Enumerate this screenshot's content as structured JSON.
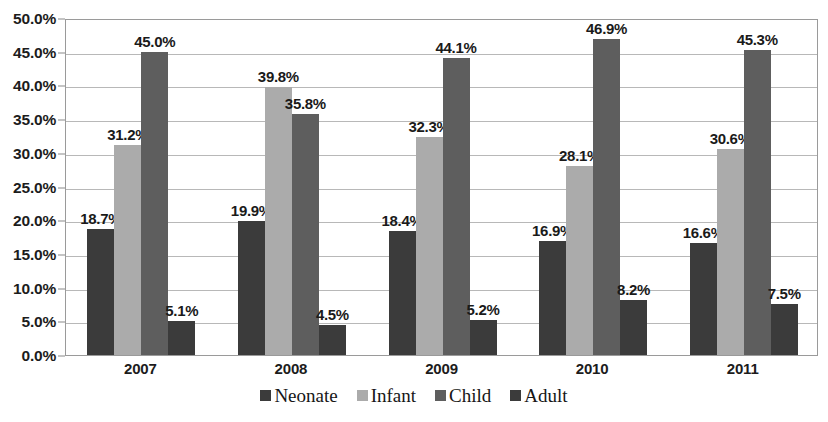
{
  "chart_data": {
    "type": "bar",
    "title": "",
    "subtitle": "",
    "xlabel": "",
    "ylabel": "",
    "categories": [
      "2007",
      "2008",
      "2009",
      "2010",
      "2011"
    ],
    "series": [
      {
        "name": "Neonate",
        "color": "#3b3b3b",
        "values": [
          18.7,
          19.9,
          18.4,
          16.9,
          16.6
        ]
      },
      {
        "name": "Infant",
        "color": "#ababab",
        "values": [
          31.2,
          39.8,
          32.3,
          28.1,
          30.6
        ]
      },
      {
        "name": "Child",
        "color": "#5e5e5e",
        "values": [
          45.0,
          35.8,
          44.1,
          46.9,
          45.3
        ]
      },
      {
        "name": "Adult",
        "color": "#3b3b3b",
        "values": [
          5.1,
          4.5,
          5.2,
          8.2,
          7.5
        ]
      }
    ],
    "data_labels": [
      [
        "18.7%",
        "31.2%",
        "45.0%",
        "5.1%"
      ],
      [
        "19.9%",
        "39.8%",
        "35.8%",
        "4.5%"
      ],
      [
        "18.4%",
        "32.3%",
        "44.1%",
        "5.2%"
      ],
      [
        "16.9%",
        "28.1%",
        "46.9%",
        "8.2%"
      ],
      [
        "16.6%",
        "30.6%",
        "45.3%",
        "7.5%"
      ]
    ],
    "ylim": [
      0,
      50
    ],
    "ytick_step": 5,
    "ytick_labels": [
      "0.0%",
      "5.0%",
      "10.0%",
      "15.0%",
      "20.0%",
      "25.0%",
      "30.0%",
      "35.0%",
      "40.0%",
      "45.0%",
      "50.0%"
    ],
    "ytick_values": [
      0,
      5,
      10,
      15,
      20,
      25,
      30,
      35,
      40,
      45,
      50
    ],
    "grid": true,
    "grid_axis": "y",
    "legend_position": "bottom",
    "legend_entries": [
      "Neonate",
      "Infant",
      "Child",
      "Adult"
    ],
    "plot_background": "#ffffff",
    "axis_color": "#9a9a9a",
    "gridline_color": "#b8b8b8",
    "text_color": "#1c1c1c"
  }
}
